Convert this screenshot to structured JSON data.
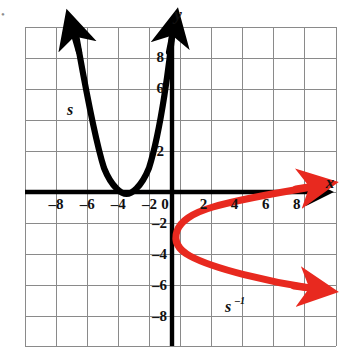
{
  "figure": {
    "background_color": "#ffffff",
    "grid_color": "#8a8a8a",
    "axis_color": "#000000",
    "curve_color_s": "#000000",
    "curve_color_s_inverse": "#e8291f"
  },
  "axes": {
    "x_axis_label": "x",
    "y_axis_label": "y",
    "origin_label": "0",
    "x_range": [
      -10,
      10
    ],
    "y_range": [
      -10,
      10
    ],
    "grid_step": 1,
    "tick_step": 2,
    "x_ticks": [
      {
        "value": -8,
        "label": "–8"
      },
      {
        "value": -6,
        "label": "–6"
      },
      {
        "value": -4,
        "label": "–4"
      },
      {
        "value": -2,
        "label": "–2"
      },
      {
        "value": 2,
        "label": "2"
      },
      {
        "value": 4,
        "label": "4"
      },
      {
        "value": 6,
        "label": "6"
      },
      {
        "value": 8,
        "label": "8"
      }
    ],
    "y_ticks": [
      {
        "value": 8,
        "label": "8"
      },
      {
        "value": 6,
        "label": "6"
      },
      {
        "value": 2,
        "label": "2"
      },
      {
        "value": -2,
        "label": "–2"
      },
      {
        "value": -4,
        "label": "–4"
      },
      {
        "value": -6,
        "label": "–6"
      },
      {
        "value": -8,
        "label": "–8"
      }
    ]
  },
  "curves": [
    {
      "id": "s",
      "label": "s",
      "label_superscript": "",
      "color": "#000000",
      "type": "parabola-upward",
      "vertex": [
        -3,
        0
      ],
      "description": "Upward opening parabola with vertex at (-3, 0), passing through (-6, 6) and (0, 6), arrows at both ends",
      "points": [
        [
          -6.4,
          10
        ],
        [
          -6,
          7.8
        ],
        [
          -5,
          3.4
        ],
        [
          -4,
          0.9
        ],
        [
          -3,
          0
        ],
        [
          -2,
          0.9
        ],
        [
          -1,
          3.4
        ],
        [
          0,
          6
        ],
        [
          0.6,
          9.2
        ]
      ]
    },
    {
      "id": "s-inverse",
      "label": "s",
      "label_superscript": "–1",
      "color": "#e8291f",
      "type": "parabola-rightward",
      "vertex": [
        0,
        -3
      ],
      "description": "Rightward opening parabola (inverse relation) with vertex at (0, -3), passing through (6, 0) and (6, -6), arrows at both ends",
      "points": [
        [
          9.6,
          0.3
        ],
        [
          7.8,
          -0.3
        ],
        [
          3.4,
          -1.4
        ],
        [
          0.9,
          -2.2
        ],
        [
          0,
          -3
        ],
        [
          0.9,
          -3.9
        ],
        [
          3.4,
          -4.7
        ],
        [
          6,
          -5.5
        ],
        [
          9.6,
          -6.1
        ]
      ]
    }
  ],
  "annotations": {
    "s_label_position": [
      -5.6,
      4.6
    ],
    "s_inverse_label_position": [
      2.6,
      -7.0
    ],
    "bullet_marker": "•"
  }
}
